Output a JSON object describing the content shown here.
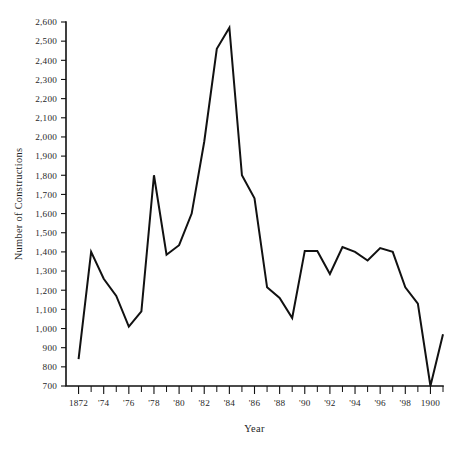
{
  "chart_data": {
    "type": "line",
    "title": "",
    "xlabel": "Year",
    "ylabel": "Number of Constructions",
    "xlim": [
      1871,
      1901
    ],
    "ylim": [
      700,
      2600
    ],
    "grid": false,
    "legend": null,
    "series_color": "#111111",
    "background_color": "#ffffff",
    "x": [
      1872,
      1873,
      1874,
      1875,
      1876,
      1877,
      1878,
      1879,
      1880,
      1881,
      1882,
      1883,
      1884,
      1885,
      1886,
      1887,
      1888,
      1889,
      1890,
      1891,
      1892,
      1893,
      1894,
      1895,
      1896,
      1897,
      1898,
      1899,
      1900,
      1901
    ],
    "values": [
      840,
      1400,
      1260,
      1170,
      1010,
      1090,
      1800,
      1385,
      1435,
      1600,
      1975,
      2460,
      2570,
      1800,
      1680,
      1215,
      1160,
      1055,
      1405,
      1405,
      1285,
      1425,
      1400,
      1355,
      1420,
      1400,
      1215,
      1130,
      700,
      970
    ],
    "series": [
      {
        "name": "Number of Constructions",
        "values": [
          840,
          1400,
          1260,
          1170,
          1010,
          1090,
          1800,
          1385,
          1435,
          1600,
          1975,
          2460,
          2570,
          1800,
          1680,
          1215,
          1160,
          1055,
          1405,
          1405,
          1285,
          1425,
          1400,
          1355,
          1420,
          1400,
          1215,
          1130,
          700,
          970
        ]
      }
    ],
    "y_ticks": [
      700,
      800,
      900,
      1000,
      1100,
      1200,
      1300,
      1400,
      1500,
      1600,
      1700,
      1800,
      1900,
      2000,
      2100,
      2200,
      2300,
      2400,
      2500,
      2600
    ],
    "y_tick_labels": [
      "700",
      "800",
      "900",
      "1,000",
      "1,100",
      "1,200",
      "1,300",
      "1,400",
      "1,500",
      "1,600",
      "1,700",
      "1,800",
      "1,900",
      "2,000",
      "2,100",
      "2,200",
      "2,300",
      "2,400",
      "2,500",
      "2,600"
    ],
    "x_ticks": [
      1872,
      1873,
      1874,
      1875,
      1876,
      1877,
      1878,
      1879,
      1880,
      1881,
      1882,
      1883,
      1884,
      1885,
      1886,
      1887,
      1888,
      1889,
      1890,
      1891,
      1892,
      1893,
      1894,
      1895,
      1896,
      1897,
      1898,
      1899,
      1900,
      1901
    ],
    "x_labeled_ticks": [
      1872,
      1874,
      1876,
      1878,
      1880,
      1882,
      1884,
      1886,
      1888,
      1890,
      1892,
      1894,
      1896,
      1898,
      1900
    ],
    "x_tick_labels": [
      "1872",
      "'74",
      "'76",
      "'78",
      "'80",
      "'82",
      "'84",
      "'86",
      "'88",
      "'90",
      "'92",
      "'94",
      "'96",
      "'98",
      "1900"
    ]
  },
  "axes": {
    "y_title": "Number of Constructions",
    "x_title": "Year"
  }
}
